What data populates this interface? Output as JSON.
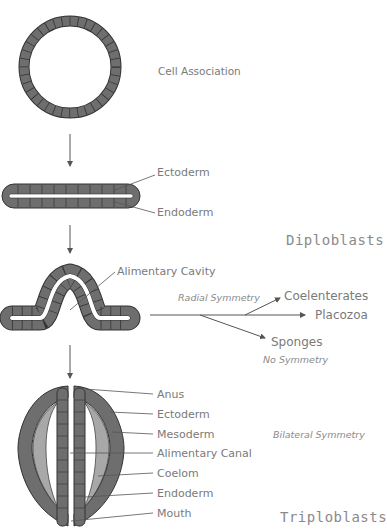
{
  "stages": {
    "cell_association": "Cell Association",
    "flat": {
      "ectoderm": "Ectoderm",
      "endoderm": "Endoderm"
    },
    "folded": {
      "cavity": "Alimentary Cavity"
    },
    "group_diplo": "Diploblasts",
    "group_triplo": "Triploblasts"
  },
  "branches": {
    "radial": "Radial Symmetry",
    "coelenterates": "Coelenterates",
    "placozoa": "Placozoa",
    "sponges": "Sponges",
    "no_symmetry": "No Symmetry"
  },
  "triplo": {
    "labels": [
      "Anus",
      "Ectoderm",
      "Mesoderm",
      "Alimentary Canal",
      "Coelom",
      "Endoderm",
      "Mouth"
    ],
    "bilateral": "Bilateral Symmetry"
  },
  "colors": {
    "cell_fill": "#6e6e6e",
    "cell_stroke": "#333333",
    "mesoderm": "#a8a8a8",
    "line": "#555555"
  }
}
